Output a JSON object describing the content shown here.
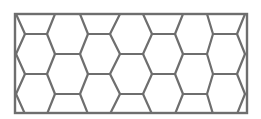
{
  "figure": {
    "type": "honeycomb-pattern",
    "stroke_color": "#6e6e6e",
    "background_color": "#ffffff",
    "frame": {
      "x": 15,
      "y": 14,
      "width": 232,
      "height": 99
    },
    "rows_a_y": [
      34,
      74,
      114
    ],
    "rows_b_y": [
      -6,
      14,
      54,
      94
    ],
    "row_a_edges": [
      [
        25,
        47
      ],
      [
        88,
        110
      ],
      [
        152,
        175
      ],
      [
        213,
        237
      ]
    ],
    "row_b_edges": [
      [
        -8,
        16
      ],
      [
        55,
        80
      ],
      [
        120,
        143
      ],
      [
        183,
        207
      ],
      [
        245,
        270
      ]
    ]
  }
}
